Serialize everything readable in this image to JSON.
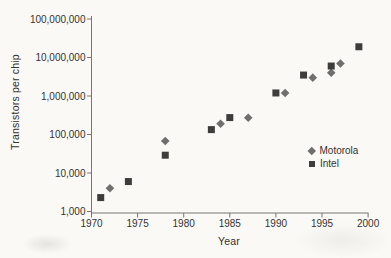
{
  "chart_data": {
    "type": "scatter",
    "xlabel": "Year",
    "ylabel": "Transistors per chip",
    "y_scale": "log",
    "grid": false,
    "xlim": [
      1970,
      2000
    ],
    "ylim": [
      1000,
      100000000
    ],
    "x_ticks": [
      1970,
      1975,
      1980,
      1985,
      1990,
      1995,
      2000
    ],
    "y_tick_labels": [
      "1,000",
      "10,000",
      "100,000",
      "1,000,000",
      "10,000,000",
      "100,000,000"
    ],
    "legend_position": "right-middle",
    "series": [
      {
        "name": "Motorola",
        "marker": "diamond",
        "color": "#6f6f6e",
        "points": [
          {
            "year": 1972,
            "transistors": 4000
          },
          {
            "year": 1978,
            "transistors": 68000
          },
          {
            "year": 1984,
            "transistors": 190000
          },
          {
            "year": 1987,
            "transistors": 273000
          },
          {
            "year": 1991,
            "transistors": 1200000
          },
          {
            "year": 1994,
            "transistors": 3000000
          },
          {
            "year": 1996,
            "transistors": 4000000
          },
          {
            "year": 1997,
            "transistors": 7000000
          }
        ]
      },
      {
        "name": "Intel",
        "marker": "square",
        "color": "#3d3d3c",
        "points": [
          {
            "year": 1971,
            "transistors": 2300
          },
          {
            "year": 1974,
            "transistors": 6000
          },
          {
            "year": 1978,
            "transistors": 29000
          },
          {
            "year": 1983,
            "transistors": 134000
          },
          {
            "year": 1985,
            "transistors": 275000
          },
          {
            "year": 1990,
            "transistors": 1200000
          },
          {
            "year": 1993,
            "transistors": 3500000
          },
          {
            "year": 1996,
            "transistors": 6000000
          },
          {
            "year": 1999,
            "transistors": 19000000
          }
        ]
      }
    ]
  }
}
